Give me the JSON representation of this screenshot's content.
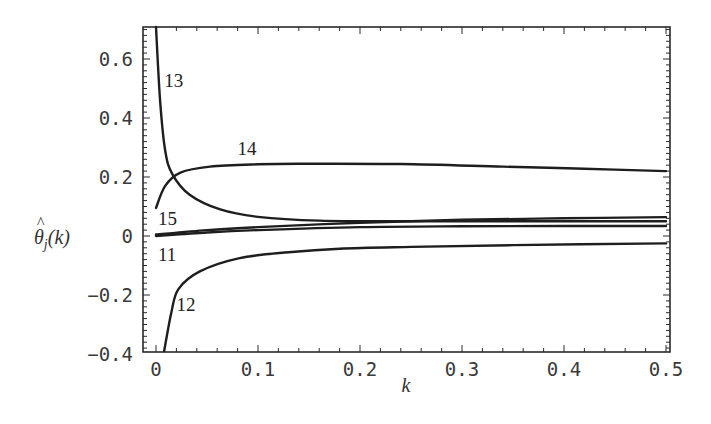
{
  "chart_data": {
    "type": "line",
    "title": "",
    "xlabel": "k",
    "ylabel": "θ̂_j(k)",
    "xlim": [
      0,
      0.5
    ],
    "ylim": [
      -0.4,
      0.7
    ],
    "grid": false,
    "legend": "none (curves labeled inline)",
    "x_ticks": [
      "0",
      "0.1",
      "0.2",
      "0.3",
      "0.4",
      "0.5"
    ],
    "y_ticks": [
      "-0.4",
      "-0.2",
      "0",
      "0.2",
      "0.4",
      "0.6"
    ],
    "series": [
      {
        "name": "13",
        "points": [
          [
            0.0,
            0.71
          ],
          [
            0.004,
            0.46
          ],
          [
            0.009,
            0.29
          ],
          [
            0.016,
            0.21
          ],
          [
            0.033,
            0.14
          ],
          [
            0.063,
            0.09
          ],
          [
            0.1,
            0.065
          ],
          [
            0.16,
            0.052
          ],
          [
            0.25,
            0.05
          ],
          [
            0.35,
            0.05
          ],
          [
            0.5,
            0.05
          ]
        ]
      },
      {
        "name": "14",
        "points": [
          [
            0.0,
            0.095
          ],
          [
            0.009,
            0.17
          ],
          [
            0.024,
            0.215
          ],
          [
            0.053,
            0.235
          ],
          [
            0.1,
            0.243
          ],
          [
            0.14,
            0.245
          ],
          [
            0.24,
            0.244
          ],
          [
            0.34,
            0.235
          ],
          [
            0.42,
            0.228
          ],
          [
            0.5,
            0.22
          ]
        ]
      },
      {
        "name": "15",
        "points": [
          [
            0.0,
            0.005
          ],
          [
            0.05,
            0.02
          ],
          [
            0.1,
            0.03
          ],
          [
            0.2,
            0.045
          ],
          [
            0.3,
            0.055
          ],
          [
            0.4,
            0.06
          ],
          [
            0.5,
            0.064
          ]
        ]
      },
      {
        "name": "11",
        "points": [
          [
            0.0,
            0.0
          ],
          [
            0.05,
            0.012
          ],
          [
            0.1,
            0.02
          ],
          [
            0.2,
            0.03
          ],
          [
            0.3,
            0.033
          ],
          [
            0.4,
            0.034
          ],
          [
            0.5,
            0.034
          ]
        ]
      },
      {
        "name": "12",
        "points": [
          [
            0.008,
            -0.39
          ],
          [
            0.015,
            -0.26
          ],
          [
            0.022,
            -0.18
          ],
          [
            0.043,
            -0.12
          ],
          [
            0.082,
            -0.075
          ],
          [
            0.13,
            -0.055
          ],
          [
            0.18,
            -0.043
          ],
          [
            0.25,
            -0.037
          ],
          [
            0.35,
            -0.031
          ],
          [
            0.5,
            -0.025
          ]
        ]
      }
    ],
    "annotations": [
      {
        "text": "13",
        "k": 0.008,
        "v": 0.53
      },
      {
        "text": "14",
        "k": 0.08,
        "v": 0.3
      },
      {
        "text": "15",
        "k": 0.002,
        "v": 0.06
      },
      {
        "text": "11",
        "k": 0.002,
        "v": -0.06
      },
      {
        "text": "12",
        "k": 0.02,
        "v": -0.23
      }
    ]
  }
}
